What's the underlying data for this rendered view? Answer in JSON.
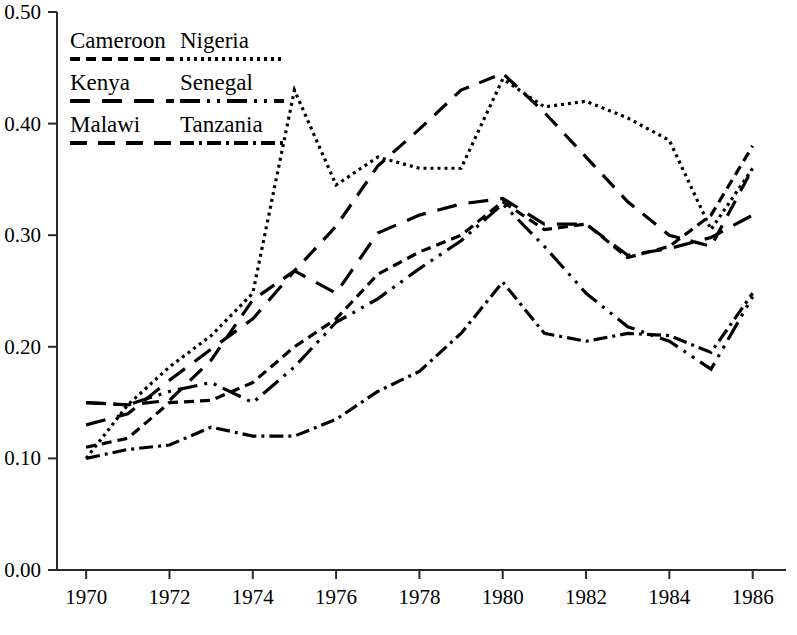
{
  "chart_data": {
    "type": "line",
    "title": "",
    "subtitle": "",
    "xlabel": "",
    "ylabel": "",
    "xlim": [
      1969.3,
      1986.8
    ],
    "ylim": [
      0.0,
      0.5
    ],
    "grid": false,
    "legend_position": "top-left",
    "x": [
      1970,
      1971,
      1972,
      1973,
      1974,
      1975,
      1976,
      1977,
      1978,
      1979,
      1980,
      1981,
      1982,
      1983,
      1984,
      1985,
      1986
    ],
    "xticks": [
      1970,
      1972,
      1974,
      1976,
      1978,
      1980,
      1982,
      1984,
      1986
    ],
    "xtick_labels": [
      "1970",
      "1972",
      "1974",
      "1976",
      "1978",
      "1980",
      "1982",
      "1984",
      "1986"
    ],
    "yticks": [
      0.0,
      0.1,
      0.2,
      0.3,
      0.4,
      0.5
    ],
    "ytick_labels": [
      "0.00",
      "0.10",
      "0.20",
      "0.30",
      "0.40",
      "0.50"
    ],
    "series": [
      {
        "name": "Cameroon",
        "dash": "10,6",
        "values": [
          0.11,
          0.118,
          0.15,
          0.152,
          0.168,
          0.2,
          0.225,
          0.265,
          0.285,
          0.3,
          0.33,
          0.305,
          0.31,
          0.28,
          0.29,
          0.318,
          0.38
        ]
      },
      {
        "name": "Nigeria",
        "dash": "3,4",
        "values": [
          0.1,
          0.148,
          0.182,
          0.21,
          0.248,
          0.43,
          0.345,
          0.37,
          0.36,
          0.36,
          0.44,
          0.415,
          0.42,
          0.405,
          0.385,
          0.305,
          0.36
        ]
      },
      {
        "name": "Kenya",
        "dash": "20,12",
        "values": [
          0.13,
          0.14,
          0.17,
          0.198,
          0.225,
          0.268,
          0.248,
          0.302,
          0.318,
          0.328,
          0.333,
          0.31,
          0.31,
          0.282,
          0.288,
          0.298,
          0.318
        ]
      },
      {
        "name": "Senegal",
        "dash": "20,7,3,7,3,7",
        "values": [
          0.15,
          0.148,
          0.16,
          0.168,
          0.15,
          0.182,
          0.222,
          0.243,
          0.27,
          0.295,
          0.328,
          0.29,
          0.248,
          0.218,
          0.205,
          0.18,
          0.245
        ]
      },
      {
        "name": "Malawi",
        "dash": "17,11",
        "values": [
          0.15,
          0.148,
          0.152,
          0.188,
          0.242,
          0.268,
          0.308,
          0.362,
          0.395,
          0.43,
          0.445,
          0.41,
          0.37,
          0.33,
          0.3,
          0.29,
          0.36
        ]
      },
      {
        "name": "Tanzania",
        "dash": "14,5,3,5,14,5,3,5",
        "values": [
          0.1,
          0.108,
          0.112,
          0.128,
          0.12,
          0.12,
          0.135,
          0.16,
          0.178,
          0.212,
          0.258,
          0.212,
          0.205,
          0.212,
          0.21,
          0.195,
          0.248
        ]
      }
    ]
  },
  "legend": {
    "entries": [
      {
        "label": "Cameroon",
        "series": "Cameroon"
      },
      {
        "label": "Nigeria",
        "series": "Nigeria"
      },
      {
        "label": "Kenya",
        "series": "Kenya"
      },
      {
        "label": "Senegal",
        "series": "Senegal"
      },
      {
        "label": "Malawi",
        "series": "Malawi"
      },
      {
        "label": "Tanzania",
        "series": "Tanzania"
      }
    ]
  },
  "colors": {
    "ink": "#000000",
    "axis": "#2a2a2a",
    "background": "#ffffff"
  }
}
